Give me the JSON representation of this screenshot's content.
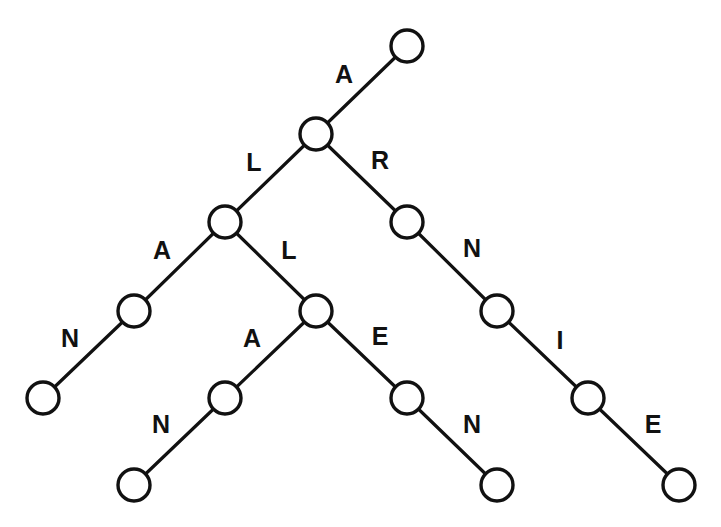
{
  "diagram": {
    "type": "trie",
    "colors": {
      "stroke": "#111111",
      "background": "#ffffff",
      "node_fill": "#ffffff"
    },
    "nodes": [
      {
        "id": "root",
        "x": 407,
        "y": 46
      },
      {
        "id": "A",
        "x": 316,
        "y": 134
      },
      {
        "id": "AL",
        "x": 225,
        "y": 222
      },
      {
        "id": "AR",
        "x": 407,
        "y": 222
      },
      {
        "id": "ALA",
        "x": 134,
        "y": 311
      },
      {
        "id": "ALL",
        "x": 316,
        "y": 311
      },
      {
        "id": "ARN",
        "x": 497,
        "y": 311
      },
      {
        "id": "ALAN",
        "x": 43,
        "y": 398
      },
      {
        "id": "ALLA",
        "x": 225,
        "y": 398
      },
      {
        "id": "ALLE",
        "x": 407,
        "y": 398
      },
      {
        "id": "ARNI",
        "x": 588,
        "y": 398
      },
      {
        "id": "ALLAN",
        "x": 134,
        "y": 485
      },
      {
        "id": "ALLEN",
        "x": 497,
        "y": 485
      },
      {
        "id": "ARNIE",
        "x": 679,
        "y": 485
      }
    ],
    "edges": [
      {
        "from": "root",
        "to": "A",
        "label": "A",
        "lx": 344,
        "ly": 74
      },
      {
        "from": "A",
        "to": "AL",
        "label": "L",
        "lx": 254,
        "ly": 162
      },
      {
        "from": "A",
        "to": "AR",
        "label": "R",
        "lx": 380,
        "ly": 160
      },
      {
        "from": "AL",
        "to": "ALA",
        "label": "A",
        "lx": 162,
        "ly": 250
      },
      {
        "from": "AL",
        "to": "ALL",
        "label": "L",
        "lx": 289,
        "ly": 250
      },
      {
        "from": "AR",
        "to": "ARN",
        "label": "N",
        "lx": 472,
        "ly": 248
      },
      {
        "from": "ALA",
        "to": "ALAN",
        "label": "N",
        "lx": 70,
        "ly": 338
      },
      {
        "from": "ALL",
        "to": "ALLA",
        "label": "A",
        "lx": 252,
        "ly": 338
      },
      {
        "from": "ALL",
        "to": "ALLE",
        "label": "E",
        "lx": 380,
        "ly": 336
      },
      {
        "from": "ARN",
        "to": "ARNI",
        "label": "I",
        "lx": 560,
        "ly": 340
      },
      {
        "from": "ALLA",
        "to": "ALLAN",
        "label": "N",
        "lx": 161,
        "ly": 424
      },
      {
        "from": "ALLE",
        "to": "ALLEN",
        "label": "N",
        "lx": 472,
        "ly": 424
      },
      {
        "from": "ARNI",
        "to": "ARNIE",
        "label": "E",
        "lx": 653,
        "ly": 424
      }
    ],
    "node_radius": 16
  }
}
